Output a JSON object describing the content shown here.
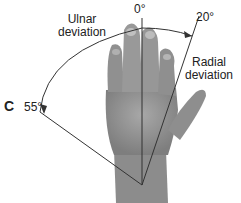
{
  "panel_label": "C",
  "labels": {
    "ulnar": [
      "Ulnar",
      "deviation"
    ],
    "radial": [
      "Radial",
      "deviation"
    ],
    "zero": "0°",
    "radial_angle": "20°",
    "ulnar_angle": "55°"
  },
  "diagram": {
    "pivot": [
      142,
      185
    ],
    "neutral_axis_deg": 0,
    "radial_deviation_deg": 20,
    "ulnar_deviation_deg": 55
  }
}
